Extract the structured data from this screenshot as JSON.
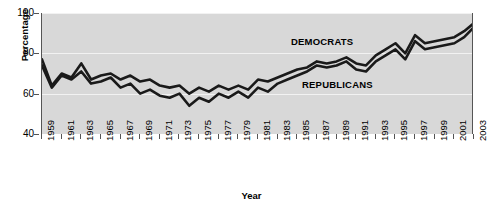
{
  "chart_data": {
    "type": "line",
    "title": "",
    "xlabel": "Year",
    "ylabel": "Percentage",
    "ylim": [
      40,
      100
    ],
    "xlim": [
      1959,
      2003
    ],
    "yticks": [
      40,
      60,
      80,
      100
    ],
    "xticks": [
      1959,
      1961,
      1963,
      1965,
      1967,
      1969,
      1971,
      1973,
      1975,
      1977,
      1979,
      1981,
      1983,
      1985,
      1987,
      1989,
      1991,
      1993,
      1995,
      1997,
      1999,
      2001,
      2003
    ],
    "grid": true,
    "legend_position": "inline-annotation",
    "x": [
      1959,
      1960,
      1961,
      1962,
      1963,
      1964,
      1965,
      1966,
      1967,
      1968,
      1969,
      1970,
      1971,
      1972,
      1973,
      1974,
      1975,
      1976,
      1977,
      1978,
      1979,
      1980,
      1981,
      1982,
      1983,
      1984,
      1985,
      1986,
      1987,
      1988,
      1989,
      1990,
      1991,
      1992,
      1993,
      1994,
      1995,
      1996,
      1997,
      1998,
      1999,
      2000,
      2001,
      2002,
      2003
    ],
    "series": [
      {
        "name": "DEMOCRATS",
        "color": "#1a1a1a",
        "values": [
          77,
          64,
          70,
          68,
          75,
          67,
          69,
          70,
          67,
          69,
          66,
          67,
          64,
          63,
          64,
          60,
          63,
          61,
          64,
          62,
          64,
          62,
          67,
          66,
          68,
          70,
          72,
          73,
          76,
          75,
          76,
          78,
          75,
          74,
          79,
          82,
          85,
          80,
          89,
          85,
          86,
          87,
          88,
          91,
          95
        ]
      },
      {
        "name": "REPUBLICANS",
        "color": "#1a1a1a",
        "values": [
          74,
          63,
          69,
          67,
          71,
          65,
          66,
          68,
          63,
          65,
          60,
          62,
          59,
          58,
          60,
          54,
          58,
          56,
          60,
          58,
          61,
          58,
          63,
          61,
          65,
          67,
          69,
          71,
          74,
          73,
          74,
          76,
          72,
          71,
          76,
          79,
          82,
          77,
          86,
          82,
          83,
          84,
          85,
          88,
          93
        ]
      }
    ],
    "annotations": [
      {
        "text": "DEMOCRATS",
        "series": "DEMOCRATS"
      },
      {
        "text": "REPUBLICANS",
        "series": "REPUBLICANS"
      }
    ]
  }
}
